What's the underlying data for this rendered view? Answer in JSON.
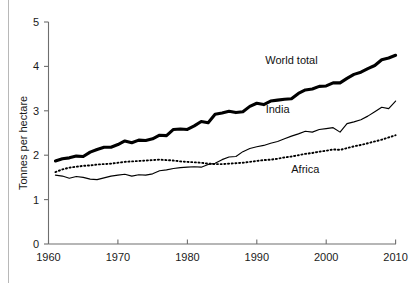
{
  "chart_data": {
    "type": "line",
    "title": "",
    "xlabel": "",
    "ylabel": "Tonnes per hectare",
    "xlim": [
      1960,
      2010
    ],
    "ylim": [
      0,
      5
    ],
    "grid": false,
    "legend_position": "inline-annotations",
    "xticks": [
      1960,
      1970,
      1980,
      1990,
      2000,
      2010
    ],
    "yticks": [
      0,
      1,
      2,
      3,
      4,
      5
    ],
    "x": [
      1961,
      1962,
      1963,
      1964,
      1965,
      1966,
      1967,
      1968,
      1969,
      1970,
      1971,
      1972,
      1973,
      1974,
      1975,
      1976,
      1977,
      1978,
      1979,
      1980,
      1981,
      1982,
      1983,
      1984,
      1985,
      1986,
      1987,
      1988,
      1989,
      1990,
      1991,
      1992,
      1993,
      1994,
      1995,
      1996,
      1997,
      1998,
      1999,
      2000,
      2001,
      2002,
      2003,
      2004,
      2005,
      2006,
      2007,
      2008,
      2009,
      2010
    ],
    "series": [
      {
        "name": "World total",
        "style": "thick-solid",
        "label_x": 1995,
        "label_y": 4.05,
        "values": [
          1.87,
          1.92,
          1.94,
          1.98,
          1.97,
          2.07,
          2.13,
          2.18,
          2.18,
          2.24,
          2.32,
          2.28,
          2.34,
          2.33,
          2.37,
          2.45,
          2.44,
          2.58,
          2.59,
          2.58,
          2.66,
          2.76,
          2.73,
          2.92,
          2.95,
          2.99,
          2.96,
          2.98,
          3.1,
          3.17,
          3.14,
          3.22,
          3.24,
          3.26,
          3.27,
          3.39,
          3.47,
          3.49,
          3.55,
          3.56,
          3.63,
          3.63,
          3.73,
          3.82,
          3.87,
          3.95,
          4.02,
          4.15,
          4.19,
          4.25
        ]
      },
      {
        "name": "India",
        "style": "thin-solid",
        "label_x": 1993,
        "label_y": 2.95,
        "values": [
          1.55,
          1.53,
          1.48,
          1.52,
          1.5,
          1.46,
          1.45,
          1.49,
          1.53,
          1.55,
          1.57,
          1.53,
          1.56,
          1.55,
          1.58,
          1.65,
          1.67,
          1.7,
          1.72,
          1.73,
          1.74,
          1.73,
          1.79,
          1.82,
          1.9,
          1.96,
          1.97,
          2.08,
          2.15,
          2.19,
          2.22,
          2.27,
          2.31,
          2.37,
          2.43,
          2.48,
          2.54,
          2.52,
          2.58,
          2.6,
          2.62,
          2.52,
          2.71,
          2.75,
          2.8,
          2.88,
          2.98,
          3.08,
          3.05,
          3.22
        ]
      },
      {
        "name": "Africa",
        "style": "dotted",
        "label_x": 1997,
        "label_y": 1.6,
        "values": [
          1.62,
          1.68,
          1.72,
          1.74,
          1.76,
          1.77,
          1.79,
          1.8,
          1.81,
          1.83,
          1.85,
          1.86,
          1.87,
          1.88,
          1.89,
          1.9,
          1.89,
          1.88,
          1.86,
          1.85,
          1.84,
          1.83,
          1.81,
          1.8,
          1.8,
          1.81,
          1.82,
          1.83,
          1.85,
          1.87,
          1.89,
          1.9,
          1.92,
          1.95,
          1.97,
          2.0,
          2.03,
          2.05,
          2.08,
          2.1,
          2.13,
          2.12,
          2.16,
          2.2,
          2.23,
          2.27,
          2.31,
          2.35,
          2.4,
          2.45
        ]
      }
    ]
  },
  "axes": {
    "y_axis_title": "Tonnes per hectare",
    "y_tick_labels": [
      "0",
      "1",
      "2",
      "3",
      "4",
      "5"
    ],
    "x_tick_labels": [
      "1960",
      "1970",
      "1980",
      "1990",
      "2000",
      "2010"
    ]
  },
  "annotations": {
    "world_total": "World total",
    "india": "India",
    "africa": "Africa"
  }
}
